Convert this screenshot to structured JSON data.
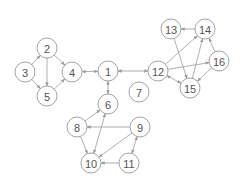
{
  "graph": {
    "node_radius": 10,
    "colors": {
      "stroke": "#9a9a9a",
      "label": "#555555",
      "fill": "#ffffff"
    },
    "nodes": [
      {
        "id": "1",
        "x": 108,
        "y": 71
      },
      {
        "id": "2",
        "x": 47,
        "y": 48
      },
      {
        "id": "3",
        "x": 25,
        "y": 72
      },
      {
        "id": "4",
        "x": 72,
        "y": 72
      },
      {
        "id": "5",
        "x": 47,
        "y": 96
      },
      {
        "id": "6",
        "x": 108,
        "y": 104
      },
      {
        "id": "7",
        "x": 139,
        "y": 92
      },
      {
        "id": "8",
        "x": 77,
        "y": 127
      },
      {
        "id": "9",
        "x": 140,
        "y": 127
      },
      {
        "id": "10",
        "x": 91,
        "y": 163
      },
      {
        "id": "11",
        "x": 129,
        "y": 163
      },
      {
        "id": "12",
        "x": 158,
        "y": 71
      },
      {
        "id": "13",
        "x": 171,
        "y": 29
      },
      {
        "id": "14",
        "x": 205,
        "y": 29
      },
      {
        "id": "15",
        "x": 190,
        "y": 88
      },
      {
        "id": "16",
        "x": 219,
        "y": 61
      }
    ],
    "edges": [
      {
        "from": "3",
        "to": "2",
        "bidirectional": false
      },
      {
        "from": "3",
        "to": "5",
        "bidirectional": false
      },
      {
        "from": "2",
        "to": "5",
        "bidirectional": false
      },
      {
        "from": "2",
        "to": "4",
        "bidirectional": false
      },
      {
        "from": "5",
        "to": "4",
        "bidirectional": false
      },
      {
        "from": "4",
        "to": "1",
        "bidirectional": true
      },
      {
        "from": "1",
        "to": "12",
        "bidirectional": true
      },
      {
        "from": "1",
        "to": "6",
        "bidirectional": true
      },
      {
        "from": "8",
        "to": "6",
        "bidirectional": false
      },
      {
        "from": "8",
        "to": "10",
        "bidirectional": false
      },
      {
        "from": "6",
        "to": "10",
        "bidirectional": true
      },
      {
        "from": "9",
        "to": "8",
        "bidirectional": false
      },
      {
        "from": "9",
        "to": "10",
        "bidirectional": false
      },
      {
        "from": "9",
        "to": "11",
        "bidirectional": true
      },
      {
        "from": "11",
        "to": "10",
        "bidirectional": false
      },
      {
        "from": "12",
        "to": "14",
        "bidirectional": false
      },
      {
        "from": "12",
        "to": "16",
        "bidirectional": false
      },
      {
        "from": "12",
        "to": "15",
        "bidirectional": true
      },
      {
        "from": "13",
        "to": "15",
        "bidirectional": false
      },
      {
        "from": "14",
        "to": "13",
        "bidirectional": false
      },
      {
        "from": "15",
        "to": "14",
        "bidirectional": false
      },
      {
        "from": "16",
        "to": "14",
        "bidirectional": false
      },
      {
        "from": "16",
        "to": "15",
        "bidirectional": false
      }
    ]
  }
}
